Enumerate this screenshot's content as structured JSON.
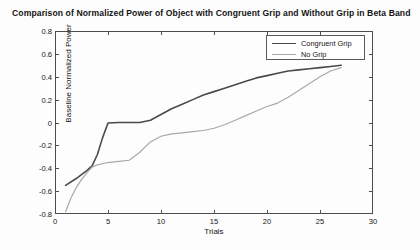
{
  "chart_data": {
    "type": "line",
    "title": "Comparison of Normalized Power of Object with Congruent Grip and Without Grip in Beta Band",
    "xlabel": "Trials",
    "ylabel": "Baseline Normalized Power",
    "xlim": [
      0,
      30
    ],
    "ylim": [
      -0.8,
      0.8
    ],
    "xticks": [
      0,
      5,
      10,
      15,
      20,
      25,
      30
    ],
    "yticks": [
      -0.8,
      -0.6,
      -0.4,
      -0.2,
      0,
      0.2,
      0.4,
      0.6,
      0.8
    ],
    "xtick_labels": [
      "0",
      "5",
      "10",
      "15",
      "20",
      "25",
      "30"
    ],
    "ytick_labels": [
      "-0.8",
      "-0.6",
      "-0.4",
      "-0.2",
      "0",
      "0.2",
      "0.4",
      "0.6",
      "0.8"
    ],
    "grid": false,
    "legend_position": "top-right",
    "series": [
      {
        "name": "Congruent Grip",
        "color": "#4a4a4a",
        "linewidth": 1.6,
        "x": [
          1,
          2,
          3,
          3.5,
          4,
          4.5,
          5,
          6,
          7,
          8,
          9,
          10,
          11,
          12,
          13,
          14,
          15,
          16,
          17,
          18,
          19,
          20,
          21,
          22,
          23,
          24,
          25,
          26,
          27
        ],
        "y": [
          -0.55,
          -0.49,
          -0.42,
          -0.38,
          -0.28,
          -0.13,
          -0.005,
          0.0,
          0.0,
          0.0,
          0.02,
          0.07,
          0.12,
          0.16,
          0.2,
          0.24,
          0.27,
          0.3,
          0.33,
          0.36,
          0.39,
          0.41,
          0.43,
          0.45,
          0.46,
          0.47,
          0.48,
          0.49,
          0.5
        ]
      },
      {
        "name": "No Grip",
        "color": "#a8a8a8",
        "linewidth": 1.2,
        "x": [
          1,
          1.5,
          2,
          2.5,
          3,
          3.5,
          4,
          5,
          6,
          7,
          8,
          9,
          10,
          11,
          12,
          13,
          14,
          15,
          16,
          17,
          18,
          19,
          20,
          21,
          22,
          23,
          24,
          25,
          26,
          27
        ],
        "y": [
          -0.78,
          -0.66,
          -0.57,
          -0.5,
          -0.44,
          -0.39,
          -0.37,
          -0.35,
          -0.34,
          -0.33,
          -0.26,
          -0.17,
          -0.12,
          -0.1,
          -0.09,
          -0.08,
          -0.07,
          -0.05,
          -0.02,
          0.02,
          0.06,
          0.1,
          0.14,
          0.17,
          0.22,
          0.28,
          0.34,
          0.4,
          0.45,
          0.48
        ]
      }
    ]
  },
  "legend": {
    "entries": [
      {
        "label": "Congruent Grip"
      },
      {
        "label": "No Grip"
      }
    ]
  },
  "colors": {
    "congruent_grip": "#4a4a4a",
    "no_grip": "#a8a8a8",
    "axis": "#4d4d4d",
    "background": "#fdfdfd"
  }
}
